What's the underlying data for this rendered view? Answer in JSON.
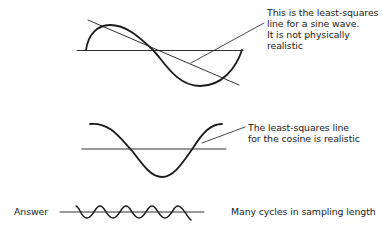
{
  "diagram": {
    "panels": [
      {
        "id": "sine",
        "curve": "sine wave (one cycle)",
        "has_fit_line": true,
        "annotation": [
          "This is the least-squares",
          "line for a sine wave.",
          "It is not physically",
          "realistic"
        ]
      },
      {
        "id": "cosine",
        "curve": "cosine wave (one cycle)",
        "has_fit_line": false,
        "annotation": [
          "The least-squares line",
          "for the cosine is realistic"
        ]
      },
      {
        "id": "answer",
        "label": "Answer",
        "curve": "many-cycle wave",
        "cycles": 5,
        "annotation": "Many cycles in sampling length"
      }
    ],
    "stroke_color": "#1a1a1a"
  }
}
